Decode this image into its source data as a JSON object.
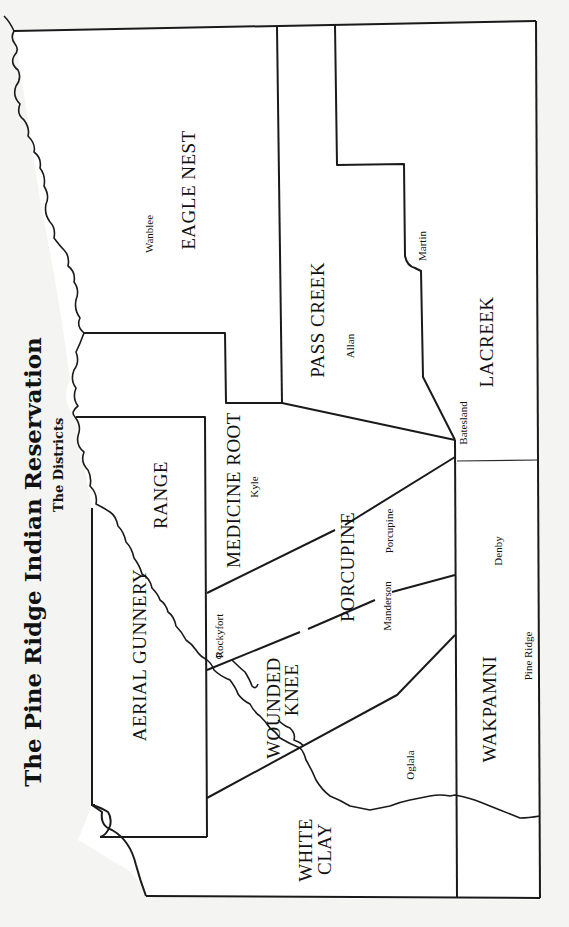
{
  "title": "The Pine Ridge Indian Reservation",
  "subtitle": "The Districts",
  "districts": {
    "eagle_nest": "EAGLE NEST",
    "pass_creek": "PASS CREEK",
    "lacreek": "LACREEK",
    "medicine_root": "MEDICINE ROOT",
    "aerial_gunnery": "AERIAL GUNNERY",
    "range": "RANGE",
    "porcupine": "PORCUPINE",
    "wounded": "WOUNDED",
    "knee": "KNEE",
    "white": "WHITE",
    "clay": "CLAY",
    "wakpamni": "WAKPAMNI"
  },
  "towns": {
    "wanblee": "Wanblee",
    "martin": "Martin",
    "allan": "Allan",
    "batesland": "Batesland",
    "kyle": "Kyle",
    "porcupine": "Porcupine",
    "manderson": "Manderson",
    "denby": "Denby",
    "rockyfort": "Rockyfort",
    "pine_ridge": "Pine Ridge",
    "oglala": "Oglala"
  },
  "colors": {
    "background": "#f4f4f3",
    "map_fill": "#ffffff",
    "lines": "#1a1a1a"
  }
}
